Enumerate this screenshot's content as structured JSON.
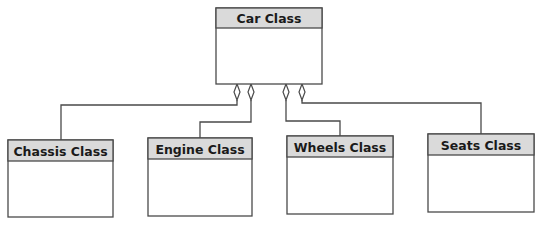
{
  "diagram": {
    "type": "UML class diagram (aggregation)",
    "parent": {
      "id": "car",
      "label": "Car Class"
    },
    "children": [
      {
        "id": "chassis",
        "label": "Chassis Class"
      },
      {
        "id": "engine",
        "label": "Engine Class"
      },
      {
        "id": "wheels",
        "label": "Wheels Class"
      },
      {
        "id": "seats",
        "label": "Seats Class"
      }
    ],
    "relationships": [
      {
        "from": "car",
        "to": "chassis",
        "kind": "aggregation"
      },
      {
        "from": "car",
        "to": "engine",
        "kind": "aggregation"
      },
      {
        "from": "car",
        "to": "wheels",
        "kind": "aggregation"
      },
      {
        "from": "car",
        "to": "seats",
        "kind": "aggregation"
      }
    ],
    "colors": {
      "header_fill": "#dadada",
      "line": "#4a4a4a",
      "text": "#1a1a1a"
    }
  }
}
